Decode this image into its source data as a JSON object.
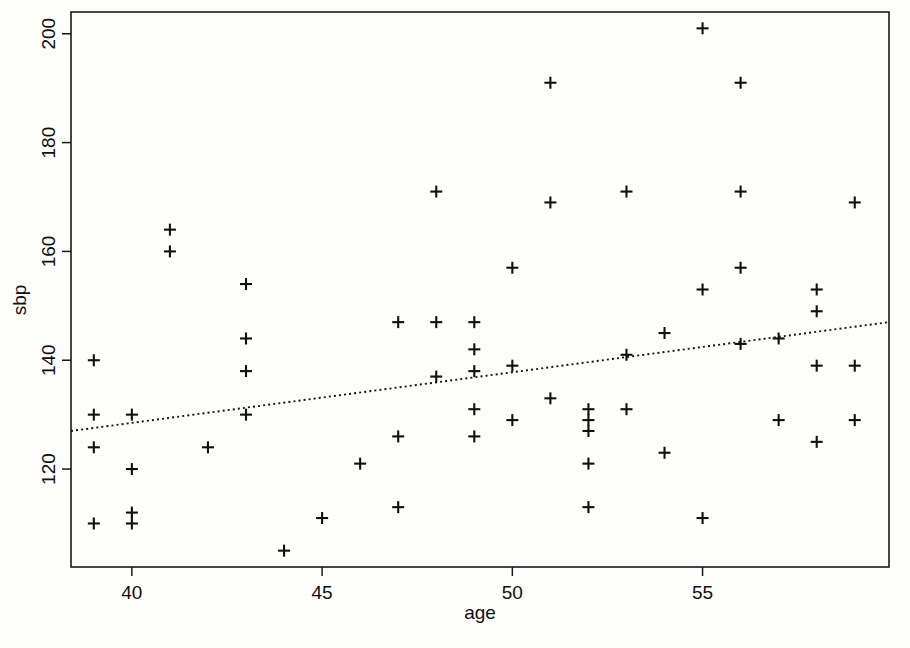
{
  "chart_data": {
    "type": "scatter",
    "title": "",
    "xlabel": "age",
    "ylabel": "sbp",
    "xlim": [
      38.4,
      59.9
    ],
    "ylim": [
      102,
      204
    ],
    "xticks": [
      40,
      45,
      50,
      55
    ],
    "yticks": [
      120,
      140,
      160,
      180,
      200
    ],
    "xtick_labels": [
      "40",
      "45",
      "50",
      "55"
    ],
    "ytick_labels": [
      "120",
      "140",
      "160",
      "180",
      "200"
    ],
    "grid": false,
    "legend": null,
    "marker": "plus",
    "marker_color": "#101010",
    "background_color": "#fdfdfc",
    "axis_color": "#1a1a1a",
    "x": [
      39,
      39,
      39,
      39,
      40,
      40,
      40,
      40,
      41,
      41,
      42,
      43,
      43,
      43,
      43,
      44,
      45,
      46,
      47,
      47,
      47,
      48,
      48,
      48,
      49,
      49,
      49,
      49,
      49,
      50,
      50,
      50,
      51,
      51,
      51,
      52,
      52,
      52,
      52,
      52,
      53,
      53,
      53,
      54,
      54,
      55,
      55,
      55,
      56,
      56,
      56,
      56,
      57,
      57,
      58,
      58,
      58,
      58,
      59,
      59,
      59
    ],
    "y": [
      140,
      130,
      124,
      110,
      130,
      120,
      112,
      110,
      164,
      160,
      124,
      154,
      144,
      138,
      130,
      105,
      111,
      121,
      147,
      126,
      113,
      171,
      147,
      137,
      147,
      142,
      138,
      131,
      126,
      157,
      139,
      129,
      191,
      169,
      133,
      131,
      129,
      127,
      121,
      113,
      171,
      141,
      131,
      145,
      123,
      201,
      153,
      111,
      191,
      171,
      157,
      143,
      144,
      129,
      153,
      149,
      139,
      125,
      169,
      139,
      129,
      118
    ],
    "fit_line": {
      "style": "dotted",
      "x_start": 38.4,
      "y_start": 127,
      "x_end": 59.9,
      "y_end": 147
    },
    "n_points": 61
  },
  "axes": {
    "x_axis_label": "age",
    "y_axis_label": "sbp"
  }
}
